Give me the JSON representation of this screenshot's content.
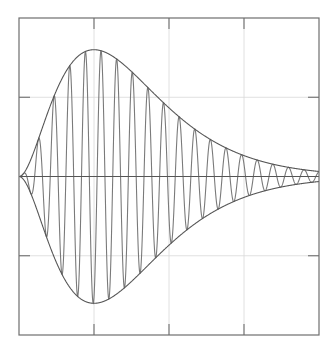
{
  "chart_data": {
    "type": "line",
    "title": "",
    "xlabel": "",
    "ylabel": "",
    "xlim": [
      0,
      4
    ],
    "ylim": [
      -2,
      2
    ],
    "grid": true,
    "x_gridlines": [
      1,
      2,
      3
    ],
    "y_gridlines": [
      -1,
      0,
      1
    ],
    "legend": null,
    "series": [
      {
        "name": "damped-oscillation",
        "description": "Carrier sine wave modulated by envelope A(t)=1.6*(t*e^(1-t))^2",
        "envelope_peak": 1.6,
        "envelope_peak_t": 1,
        "cycles": 19.2,
        "color": "#7a7a7a"
      },
      {
        "name": "upper-envelope",
        "color": "#555555"
      },
      {
        "name": "lower-envelope",
        "color": "#555555"
      }
    ],
    "envelope_samples": {
      "t": [
        0,
        0.5,
        1,
        1.5,
        2,
        2.5,
        3,
        3.5,
        4
      ],
      "amplitude": [
        0,
        1.0,
        1.6,
        1.35,
        0.95,
        0.52,
        0.26,
        0.12,
        0.07
      ]
    }
  },
  "colors": {
    "background": "#ffffff",
    "axes": "#6e6e6e",
    "grid": "#d8d8d8",
    "carrier": "#7a7a7a",
    "envelope": "#555555",
    "zero_line": "#555555"
  }
}
